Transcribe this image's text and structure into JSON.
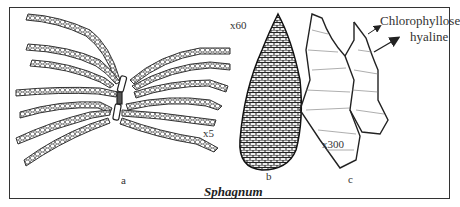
{
  "figure": {
    "caption": "Sphagnum",
    "panels": [
      {
        "id": "a",
        "label": "a",
        "magnification": "x5",
        "description": "branch with spreading leafy branches"
      },
      {
        "id": "b",
        "label": "b",
        "magnification": "x60",
        "description": "single leaf"
      },
      {
        "id": "c",
        "label": "c",
        "magnification": "x300",
        "description": "leaf cells"
      }
    ],
    "annotations": {
      "chlorophyllose": "Chlorophyllose",
      "hyaline": "hyaline"
    }
  }
}
